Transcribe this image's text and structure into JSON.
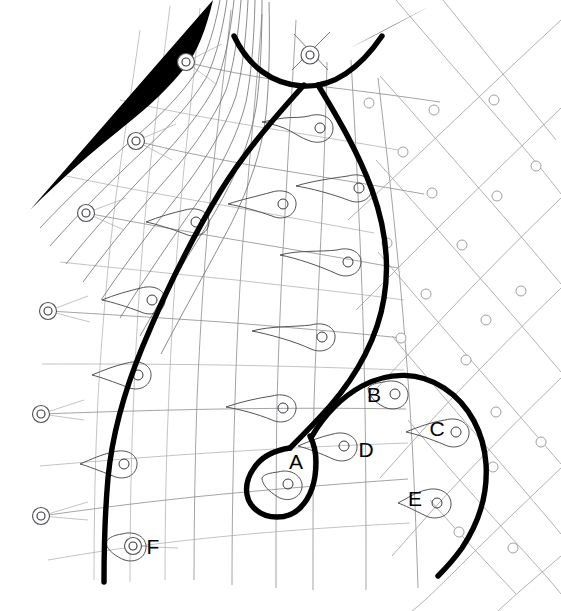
{
  "figure": {
    "background_color": "#ffffff",
    "width": 561,
    "height": 611,
    "stroke_colors": {
      "thick_boundary": "#000000",
      "grid": "#8d8d92",
      "lattice": "#a3a3a8",
      "lasso": "#4a4a4f",
      "marker_ring": "#55555a",
      "label_text": "#000000"
    }
  },
  "labels": [
    {
      "id": "A",
      "text": "A",
      "x": 296,
      "y": 463
    },
    {
      "id": "B",
      "text": "B",
      "x": 374,
      "y": 396
    },
    {
      "id": "C",
      "text": "C",
      "x": 437,
      "y": 430
    },
    {
      "id": "D",
      "text": "D",
      "x": 366,
      "y": 451
    },
    {
      "id": "E",
      "text": "E",
      "x": 415,
      "y": 500
    },
    {
      "id": "F",
      "text": "F",
      "x": 153,
      "y": 548
    }
  ],
  "ring_markers": [
    {
      "id": "ring-top",
      "x": 310,
      "y": 55,
      "r_outer": 9,
      "r_inner": 4
    },
    {
      "id": "ring-upper-left-1",
      "x": 186,
      "y": 62,
      "r_outer": 8.5,
      "r_inner": 4
    },
    {
      "id": "ring-upper-left-2",
      "x": 136,
      "y": 141,
      "r_outer": 8.5,
      "r_inner": 4
    },
    {
      "id": "ring-upper-left-3",
      "x": 86,
      "y": 213,
      "r_outer": 8.5,
      "r_inner": 4
    },
    {
      "id": "ring-left-1",
      "x": 48,
      "y": 311,
      "r_outer": 8.5,
      "r_inner": 4
    },
    {
      "id": "ring-left-2",
      "x": 41,
      "y": 414,
      "r_outer": 8.5,
      "r_inner": 4
    },
    {
      "id": "ring-left-3",
      "x": 41,
      "y": 516,
      "r_outer": 8.5,
      "r_inner": 4
    },
    {
      "id": "ring-f",
      "x": 133,
      "y": 546,
      "r_outer": 8.5,
      "r_inner": 4
    }
  ],
  "lasso_loops": [
    {
      "id": "lasso-1",
      "dot_x": 320,
      "dot_y": 128,
      "dot_r": 5
    },
    {
      "id": "lasso-2",
      "dot_x": 283,
      "dot_y": 204,
      "dot_r": 5
    },
    {
      "id": "lasso-3",
      "dot_x": 359,
      "dot_y": 188,
      "dot_r": 5
    },
    {
      "id": "lasso-4",
      "dot_x": 196,
      "dot_y": 222,
      "dot_r": 5
    },
    {
      "id": "lasso-5",
      "dot_x": 348,
      "dot_y": 262,
      "dot_r": 5
    },
    {
      "id": "lasso-6",
      "dot_x": 152,
      "dot_y": 300,
      "dot_r": 5
    },
    {
      "id": "lasso-7",
      "dot_x": 322,
      "dot_y": 337,
      "dot_r": 5
    },
    {
      "id": "lasso-8",
      "dot_x": 138,
      "dot_y": 375,
      "dot_r": 5
    },
    {
      "id": "lasso-9",
      "dot_x": 283,
      "dot_y": 408,
      "dot_r": 5
    },
    {
      "id": "lasso-10",
      "dot_x": 124,
      "dot_y": 464,
      "dot_r": 5
    },
    {
      "id": "lasso-a",
      "dot_x": 288,
      "dot_y": 484,
      "dot_r": 5
    },
    {
      "id": "lasso-b",
      "dot_x": 395,
      "dot_y": 394,
      "dot_r": 5
    },
    {
      "id": "lasso-c",
      "dot_x": 456,
      "dot_y": 432,
      "dot_r": 5
    },
    {
      "id": "lasso-d",
      "dot_x": 344,
      "dot_y": 446,
      "dot_r": 5
    },
    {
      "id": "lasso-e",
      "dot_x": 437,
      "dot_y": 503,
      "dot_r": 5
    }
  ],
  "lattice_dots": [
    {
      "x": 369,
      "y": 103
    },
    {
      "x": 434,
      "y": 110
    },
    {
      "x": 494,
      "y": 100
    },
    {
      "x": 403,
      "y": 152
    },
    {
      "x": 497,
      "y": 196
    },
    {
      "x": 432,
      "y": 193
    },
    {
      "x": 387,
      "y": 243
    },
    {
      "x": 462,
      "y": 245
    },
    {
      "x": 521,
      "y": 291
    },
    {
      "x": 426,
      "y": 294
    },
    {
      "x": 486,
      "y": 320
    },
    {
      "x": 401,
      "y": 338
    },
    {
      "x": 466,
      "y": 360
    },
    {
      "x": 496,
      "y": 412
    },
    {
      "x": 493,
      "y": 467
    },
    {
      "x": 459,
      "y": 532
    },
    {
      "x": 513,
      "y": 548
    },
    {
      "x": 536,
      "y": 166
    },
    {
      "x": 541,
      "y": 442
    },
    {
      "x": 351,
      "y": 56
    }
  ]
}
